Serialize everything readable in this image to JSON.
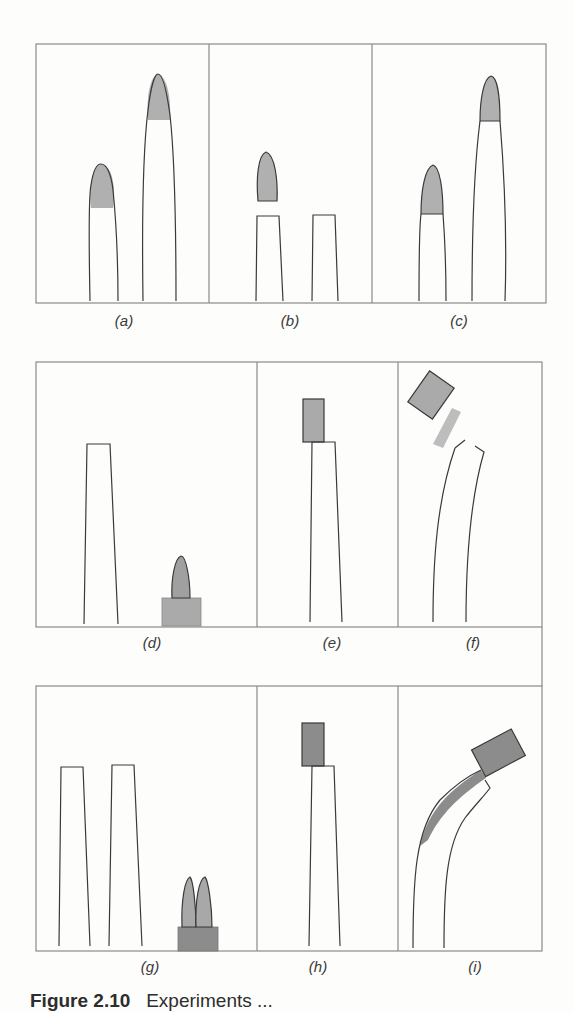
{
  "figure": {
    "panels": [
      {
        "id": "a",
        "label": "(a)"
      },
      {
        "id": "b",
        "label": "(b)"
      },
      {
        "id": "c",
        "label": "(c)"
      },
      {
        "id": "d",
        "label": "(d)"
      },
      {
        "id": "e",
        "label": "(e)"
      },
      {
        "id": "f",
        "label": "(f)"
      },
      {
        "id": "g",
        "label": "(g)"
      },
      {
        "id": "h",
        "label": "(h)"
      },
      {
        "id": "i",
        "label": "(i)"
      }
    ],
    "caption": {
      "number": "Figure 2.10",
      "text": "Experiments ..."
    },
    "colors": {
      "frame": "#8a8a8a",
      "outline": "#3a3a3a",
      "tip_fill": "#b0b0b0",
      "block_light": "#a8a8a8",
      "block_dark": "#8c8c8c",
      "background": "#fdfdfb"
    }
  }
}
